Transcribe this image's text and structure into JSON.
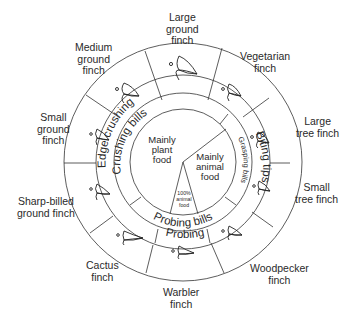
{
  "diagram": {
    "center_food": {
      "plant": [
        "Mainly",
        "plant",
        "food"
      ],
      "animal": [
        "Mainly",
        "animal",
        "food"
      ],
      "all_animal": [
        "100%",
        "animal",
        "food"
      ]
    },
    "inner_ring": {
      "crushing": "Crushing bills",
      "grasping": "Grasping bills",
      "probing": "Probing bills"
    },
    "middle_ring": {
      "edge_crushing": "Edge crushing",
      "biting_tips": "Biting tips",
      "probing": "Probing"
    },
    "finches": [
      {
        "name_lines": [
          "Large",
          "ground",
          "finch"
        ],
        "icon": "large-ground-finch-beak-icon"
      },
      {
        "name_lines": [
          "Vegetarian",
          "finch"
        ],
        "icon": "vegetarian-finch-beak-icon"
      },
      {
        "name_lines": [
          "Large",
          "tree finch"
        ],
        "icon": "large-tree-finch-beak-icon"
      },
      {
        "name_lines": [
          "Small",
          "tree finch"
        ],
        "icon": "small-tree-finch-beak-icon"
      },
      {
        "name_lines": [
          "Woodpecker",
          "finch"
        ],
        "icon": "woodpecker-finch-beak-icon"
      },
      {
        "name_lines": [
          "Warbler",
          "finch"
        ],
        "icon": "warbler-finch-beak-icon"
      },
      {
        "name_lines": [
          "Cactus",
          "finch"
        ],
        "icon": "cactus-finch-beak-icon"
      },
      {
        "name_lines": [
          "Sharp-billed",
          "ground finch"
        ],
        "icon": "sharp-billed-ground-finch-beak-icon"
      },
      {
        "name_lines": [
          "Small",
          "ground",
          "finch"
        ],
        "icon": "small-ground-finch-beak-icon"
      },
      {
        "name_lines": [
          "Medium",
          "ground",
          "finch"
        ],
        "icon": "medium-ground-finch-beak-icon"
      }
    ]
  }
}
